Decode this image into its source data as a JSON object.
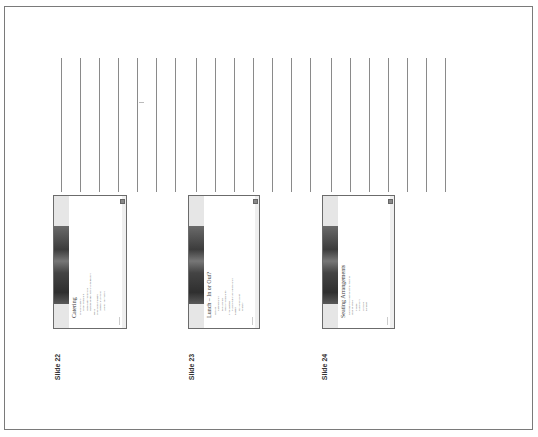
{
  "page": {
    "type": "handout-notes-page",
    "orientation": "rotated-90-ccw"
  },
  "note_lines": {
    "count": 21,
    "x_positions": [
      61,
      80,
      99,
      118,
      137,
      156,
      175,
      196,
      215,
      234,
      253,
      272,
      291,
      310,
      331,
      350,
      369,
      388,
      407,
      426,
      445
    ]
  },
  "slides": [
    {
      "label": "Slide 22",
      "title": "Catering",
      "bullets": [
        {
          "text": "Who will cater?",
          "level": 1
        },
        {
          "text": "Local restaurant",
          "level": 2
        },
        {
          "text": "Hotel catering service",
          "level": 2
        },
        {
          "text": "Outside vendor with on-site delivery",
          "level": 2
        },
        {
          "text": "Menu",
          "level": 1
        },
        {
          "text": "Special diet needs?",
          "level": 1
        },
        {
          "text": "Vegetarian options",
          "level": 2
        },
        {
          "text": "Allergy information",
          "level": 2
        }
      ]
    },
    {
      "label": "Slide 23",
      "title": "Lunch – In or Out?",
      "bullets": [
        {
          "text": "Options",
          "level": 1
        },
        {
          "text": "Catered lunch",
          "level": 2
        },
        {
          "text": "Box lunches",
          "level": 2
        },
        {
          "text": "Nearby restaurants",
          "level": 2
        },
        {
          "text": "Time allotted",
          "level": 1
        },
        {
          "text": "Transportation for off-site lunch",
          "level": 2
        },
        {
          "text": "Budget",
          "level": 1
        },
        {
          "text": "Per person cost",
          "level": 2
        },
        {
          "text": "Gratuity",
          "level": 2
        }
      ]
    },
    {
      "label": "Slide 24",
      "title": "Seating Arrangements",
      "bullets": [
        {
          "text": "Depends on objective of the meeting",
          "level": 1
        },
        {
          "text": "Seating styles",
          "level": 1
        },
        {
          "text": "Theater",
          "level": 2
        },
        {
          "text": "Classroom",
          "level": 2
        },
        {
          "text": "U-shape",
          "level": 2
        },
        {
          "text": "Banquet",
          "level": 2
        }
      ]
    }
  ],
  "colors": {
    "frame": "#7a7a7a",
    "lines": "#8a8a8a",
    "slide_border": "#6b6b6b",
    "slide_band": "#e6e6e6",
    "label_text": "#333333"
  }
}
